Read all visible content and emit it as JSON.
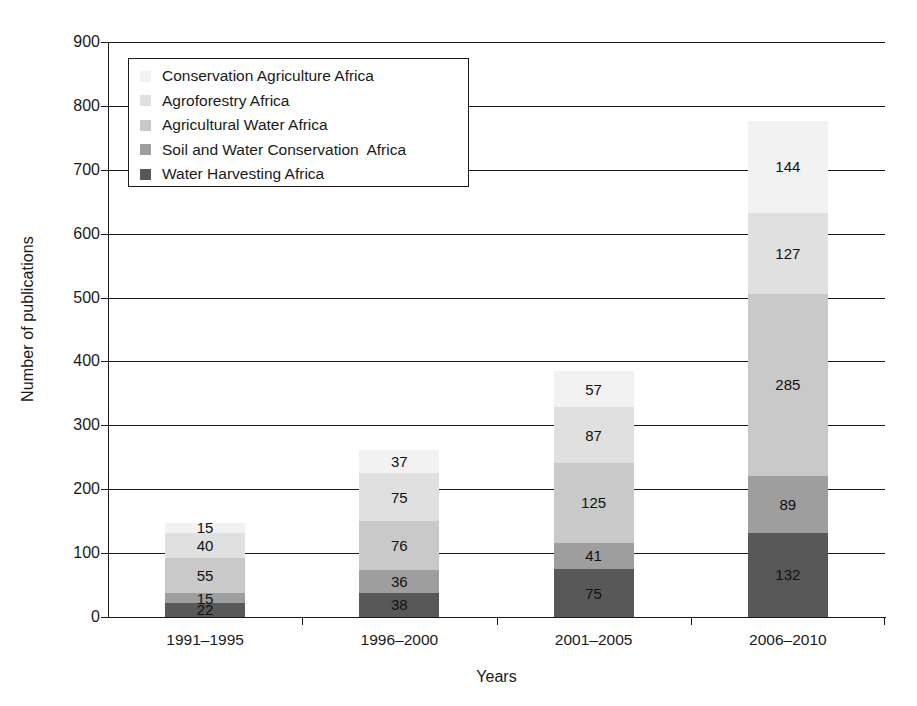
{
  "chart_data": {
    "type": "bar",
    "subtype": "stacked-bar",
    "title": "",
    "xlabel": "Years",
    "ylabel": "Number of publications",
    "categories": [
      "1991–1995",
      "1996–2000",
      "2001–2005",
      "2006–2010"
    ],
    "ylim": [
      0,
      900
    ],
    "ytick_step": 100,
    "yticks": [
      0,
      100,
      200,
      300,
      400,
      500,
      600,
      700,
      800,
      900
    ],
    "ytick_labels": [
      "0",
      "100",
      "200",
      "300",
      "400",
      "500",
      "600",
      "700",
      "800",
      "900"
    ],
    "grid": "horizontal",
    "legend_position": "upper-left-inside",
    "stack_order_bottom_to_top": [
      "Water Harvesting Africa",
      "Soil and Water Conservation  Africa",
      "Agricultural Water Africa",
      "Agroforestry Africa",
      "Conservation Agriculture Africa"
    ],
    "series": [
      {
        "name": "Conservation Agriculture Africa",
        "color": "#f2f2f2",
        "values": [
          15,
          37,
          57,
          144
        ]
      },
      {
        "name": "Agroforestry Africa",
        "color": "#e0e0e0",
        "values": [
          40,
          75,
          87,
          127
        ]
      },
      {
        "name": "Agricultural Water Africa",
        "color": "#c9c9c9",
        "values": [
          55,
          76,
          125,
          285
        ]
      },
      {
        "name": "Soil and Water Conservation  Africa",
        "color": "#9e9e9e",
        "values": [
          15,
          36,
          41,
          89
        ]
      },
      {
        "name": "Water Harvesting Africa",
        "color": "#585858",
        "values": [
          22,
          38,
          75,
          132
        ]
      }
    ],
    "totals": [
      147,
      262,
      385,
      777
    ]
  },
  "legend": {
    "items": [
      {
        "label": "Conservation Agriculture Africa",
        "color": "#f2f2f2"
      },
      {
        "label": "Agroforestry Africa",
        "color": "#e0e0e0"
      },
      {
        "label": "Agricultural Water Africa",
        "color": "#c9c9c9"
      },
      {
        "label": "Soil and Water Conservation  Africa",
        "color": "#9e9e9e"
      },
      {
        "label": "Water Harvesting Africa",
        "color": "#585858"
      }
    ]
  },
  "axes": {
    "y_title": "Number of publications",
    "x_title": "Years"
  }
}
